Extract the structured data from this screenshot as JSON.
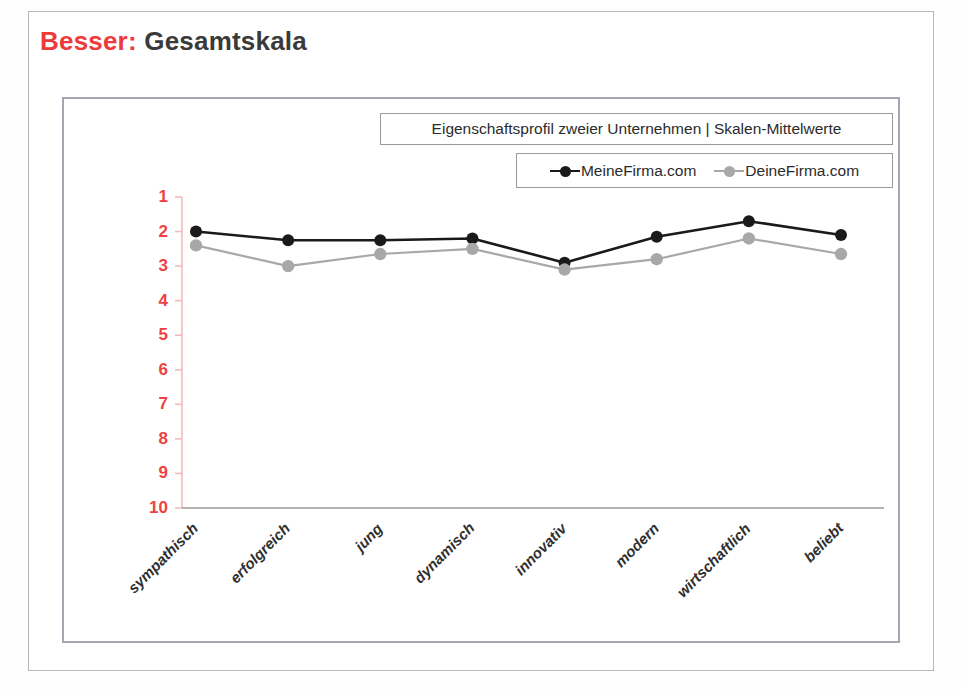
{
  "slide": {
    "title_prefix": "Besser:",
    "title_main": "Gesamtskala",
    "title_prefix_color": "#ee3a3a",
    "title_main_color": "#3a3a3a"
  },
  "chart_data": {
    "type": "line",
    "title": "Eigenschaftsprofil zweier Unternehmen | Skalen-Mittelwerte",
    "xlabel": "",
    "ylabel": "",
    "categories": [
      "sympathisch",
      "erfolgreich",
      "jung",
      "dynamisch",
      "innovativ",
      "modern",
      "wirtschaftlich",
      "beliebt"
    ],
    "yticks": [
      "1",
      "2",
      "3",
      "4",
      "5",
      "6",
      "7",
      "8",
      "9",
      "10"
    ],
    "ylim": [
      1,
      10
    ],
    "y_inverted": true,
    "grid": false,
    "legend_position": "top-right",
    "series": [
      {
        "name": "MeineFirma.com",
        "color": "#1a1a1a",
        "marker": "circle",
        "values": [
          2.0,
          2.25,
          2.25,
          2.2,
          2.9,
          2.15,
          1.7,
          2.1
        ]
      },
      {
        "name": "DeineFirma.com",
        "color": "#a8a8a8",
        "marker": "circle",
        "values": [
          2.4,
          3.0,
          2.65,
          2.5,
          3.1,
          2.8,
          2.2,
          2.65
        ]
      }
    ],
    "axis_color": "#f3bcbc",
    "tick_label_color": "#ef4141"
  }
}
